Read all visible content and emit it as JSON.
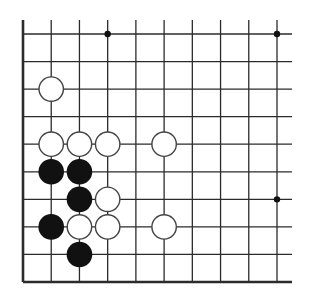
{
  "diagram": {
    "type": "go-board-fragment",
    "board": {
      "columns": 10,
      "rows": 10,
      "open_edges": [
        "top",
        "right"
      ],
      "closed_edges": [
        "left",
        "bottom"
      ],
      "line_color": "#2b2b2b",
      "background": "#ffffff"
    },
    "star_points": [
      {
        "col": 3,
        "row": 0
      },
      {
        "col": 9,
        "row": 0
      },
      {
        "col": 9,
        "row": 6
      }
    ],
    "stones": [
      {
        "color": "white",
        "col": 1,
        "row": 2
      },
      {
        "color": "white",
        "col": 1,
        "row": 4
      },
      {
        "color": "white",
        "col": 2,
        "row": 4
      },
      {
        "color": "white",
        "col": 3,
        "row": 4
      },
      {
        "color": "white",
        "col": 5,
        "row": 4
      },
      {
        "color": "black",
        "col": 1,
        "row": 5
      },
      {
        "color": "black",
        "col": 2,
        "row": 5
      },
      {
        "color": "black",
        "col": 2,
        "row": 6
      },
      {
        "color": "white",
        "col": 3,
        "row": 6
      },
      {
        "color": "black",
        "col": 1,
        "row": 7
      },
      {
        "color": "white",
        "col": 2,
        "row": 7
      },
      {
        "color": "white",
        "col": 3,
        "row": 7
      },
      {
        "color": "white",
        "col": 5,
        "row": 7
      },
      {
        "color": "black",
        "col": 2,
        "row": 8
      }
    ],
    "colors": {
      "black_stone": "#111111",
      "white_stone_fill": "#ffffff",
      "white_stone_stroke": "#444444"
    }
  }
}
